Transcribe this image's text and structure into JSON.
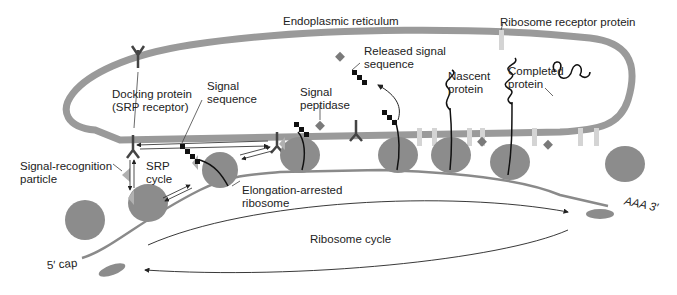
{
  "diagram": {
    "colors": {
      "membrane": "#9a9a9a",
      "ribosome": "#8c8c8c",
      "ribosome_receptor": "#d4d4d4",
      "signal_sequence": "#111111",
      "signal_peptidase": "#7a7a7a",
      "line": "#333333",
      "srp": "#b0b0b0"
    },
    "labels": {
      "er": "Endoplasmic reticulum",
      "ribosome_receptor": "Ribosome receptor protein",
      "docking_protein_1": "Docking protein",
      "docking_protein_2": "(SRP receptor)",
      "signal_sequence_1": "Signal",
      "signal_sequence_2": "sequence",
      "signal_peptidase_1": "Signal",
      "signal_peptidase_2": "peptidase",
      "released_signal_1": "Released signal",
      "released_signal_2": "sequence",
      "nascent_1": "Nascent",
      "nascent_2": "protein",
      "completed_1": "Completed",
      "completed_2": "protein",
      "srp_1": "Signal-recognition",
      "srp_2": "particle",
      "srp_cycle_1": "SRP",
      "srp_cycle_2": "cycle",
      "elongation_1": "Elongation-arrested",
      "elongation_2": "ribosome",
      "ribosome_cycle": "Ribosome cycle",
      "five_cap": "5′ cap",
      "three_end": "AAA 3′"
    }
  }
}
